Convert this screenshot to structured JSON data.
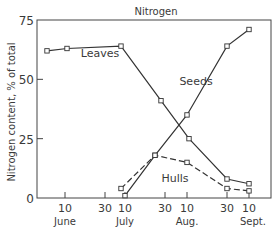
{
  "chart_data": {
    "type": "line",
    "title": "Nitrogen",
    "xlabel": "",
    "ylabel": "Nitrogen content, % of total",
    "ylim": [
      0,
      75
    ],
    "yticks": [
      0,
      25,
      50,
      75
    ],
    "grid": false,
    "legend": "inline labels",
    "x_axis_day_range": [
      0,
      103
    ],
    "xticks": [
      {
        "day": 10,
        "label": "10"
      },
      {
        "day": 30,
        "label": "30"
      },
      {
        "day": 40,
        "label": "10"
      },
      {
        "day": 60,
        "label": "30"
      },
      {
        "day": 71,
        "label": "10"
      },
      {
        "day": 91,
        "label": "30"
      },
      {
        "day": 102,
        "label": "10"
      }
    ],
    "month_labels": [
      {
        "day": 10,
        "label": "June"
      },
      {
        "day": 40,
        "label": "July"
      },
      {
        "day": 71,
        "label": "Aug."
      },
      {
        "day": 102,
        "label": "Sept."
      }
    ],
    "series": [
      {
        "name": "Leaves",
        "style": "solid",
        "points": [
          [
            1,
            62
          ],
          [
            11,
            63
          ],
          [
            38,
            64
          ],
          [
            58,
            41
          ],
          [
            72,
            25
          ],
          [
            91,
            8
          ],
          [
            102,
            6
          ]
        ],
        "label_pos": [
          100,
          57
        ]
      },
      {
        "name": "Seeds",
        "style": "solid",
        "points": [
          [
            40,
            1
          ],
          [
            55,
            18
          ],
          [
            71,
            35
          ],
          [
            91,
            64
          ],
          [
            102,
            71
          ]
        ],
        "label_pos": [
          196,
          85
        ]
      },
      {
        "name": "Hulls",
        "style": "dashed",
        "points": [
          [
            38,
            4
          ],
          [
            55,
            18
          ],
          [
            71,
            15
          ],
          [
            91,
            4
          ],
          [
            102,
            3
          ]
        ],
        "label_pos": [
          175,
          182
        ]
      }
    ]
  }
}
